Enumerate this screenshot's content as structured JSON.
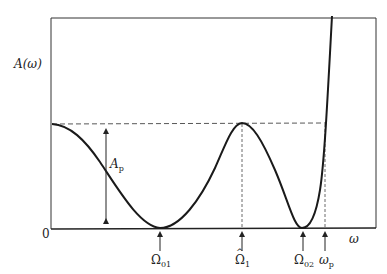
{
  "diagram": {
    "y_axis_label": "A(ω)",
    "x_axis_label": "ω",
    "origin_label": "0",
    "ripple_label": {
      "main": "A",
      "sub": "p"
    },
    "markers": [
      {
        "id": "omega01",
        "main": "Ω",
        "sub": "01",
        "hat": false
      },
      {
        "id": "omega1hat",
        "main": "Ω",
        "sub": "1",
        "hat": true
      },
      {
        "id": "omega02",
        "main": "Ω",
        "sub": "02",
        "hat": false
      },
      {
        "id": "omegap",
        "main": "ω",
        "sub": "p",
        "hat": false
      }
    ],
    "colors": {
      "stroke": "#222222",
      "background": "#ffffff"
    }
  }
}
